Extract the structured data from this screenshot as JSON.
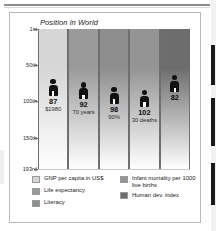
{
  "chart_data": {
    "type": "bar",
    "title": "Position in World",
    "xlabel": "",
    "ylabel": "Position in World",
    "ylim": [
      "1st",
      "193rd"
    ],
    "ytick_labels": [
      "1st",
      "50th",
      "100th",
      "150th",
      "193rd"
    ],
    "ytick_values": [
      1,
      50,
      100,
      150,
      193
    ],
    "grid": true,
    "legend_position": "bottom",
    "categories": [
      "GNP per capita in US$",
      "Life expectancy",
      "Literacy",
      "Infant mortality per 1000 live births",
      "Human dev. index"
    ],
    "values": [
      87,
      92,
      98,
      102,
      82
    ],
    "value_labels": [
      "87",
      "92",
      "98",
      "102",
      "82"
    ],
    "sub_labels": [
      "$1980",
      "70 years",
      "90%",
      "30 deaths",
      ""
    ],
    "colors": [
      "#d6d6d6",
      "#9a9a9a",
      "#8e8e8e",
      "#949494",
      "#6d6d6d"
    ]
  },
  "chart": {
    "title": "Position in World",
    "y_axis": {
      "ticks": [
        {
          "label": "1st",
          "value": 1
        },
        {
          "label": "50th",
          "value": 50
        },
        {
          "label": "100th",
          "value": 100
        },
        {
          "label": "150th",
          "value": 150
        },
        {
          "label": "193rd",
          "value": 193
        }
      ]
    },
    "bars": [
      {
        "name": "gnp-per-capita",
        "rank": "87",
        "detail": "$1980",
        "value": 87,
        "color": "#d6d6d6"
      },
      {
        "name": "life-expectancy",
        "rank": "92",
        "detail": "70 years",
        "value": 92,
        "color": "#9a9a9a"
      },
      {
        "name": "literacy",
        "rank": "98",
        "detail": "90%",
        "value": 98,
        "color": "#8e8e8e"
      },
      {
        "name": "infant-mortality",
        "rank": "102",
        "detail": "30 deaths",
        "value": 102,
        "color": "#949494"
      },
      {
        "name": "human-dev-index",
        "rank": "82",
        "detail": "",
        "value": 82,
        "color": "#6d6d6d"
      }
    ]
  },
  "legend": {
    "left": [
      {
        "label": "GNP per capita in US$",
        "color": "#d6d6d6"
      },
      {
        "label": "Life expectancy",
        "color": "#9a9a9a"
      },
      {
        "label": "Literacy",
        "color": "#8e8e8e"
      }
    ],
    "right": [
      {
        "label": "Infant mortality per 1000 live births",
        "color": "#949494"
      },
      {
        "label": "Human dev. index",
        "color": "#6d6d6d"
      }
    ]
  }
}
